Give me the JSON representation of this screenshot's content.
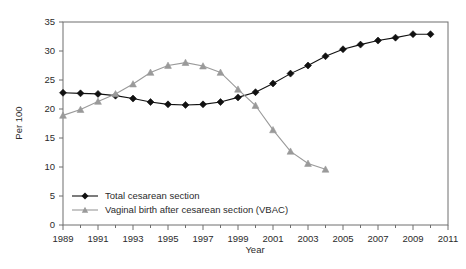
{
  "chart_data": {
    "type": "line",
    "title": "",
    "xlabel": "Year",
    "ylabel": "Per 100",
    "xlim": [
      1989,
      2011
    ],
    "ylim": [
      0,
      35
    ],
    "grid": false,
    "legend_position": "inside-bottom-left",
    "x_ticks": [
      "1989",
      "1991",
      "1993",
      "1995",
      "1997",
      "1999",
      "2001",
      "2003",
      "2005",
      "2007",
      "2009",
      "2011"
    ],
    "x_tick_values": [
      1989,
      1991,
      1993,
      1995,
      1997,
      1999,
      2001,
      2003,
      2005,
      2007,
      2009,
      2011
    ],
    "x_minor_tick_values": [
      1990,
      1992,
      1994,
      1996,
      1998,
      2000,
      2002,
      2004,
      2006,
      2008,
      2010
    ],
    "y_ticks": [
      "0",
      "5",
      "10",
      "15",
      "20",
      "25",
      "30",
      "35"
    ],
    "y_tick_values": [
      0,
      5,
      10,
      15,
      20,
      25,
      30,
      35
    ],
    "series": [
      {
        "name": "Total cesarean section",
        "marker": "diamond",
        "color": "#111111",
        "x": [
          1989,
          1990,
          1991,
          1992,
          1993,
          1994,
          1995,
          1996,
          1997,
          1998,
          1999,
          2000,
          2001,
          2002,
          2003,
          2004,
          2005,
          2006,
          2007,
          2008,
          2009,
          2010
        ],
        "values": [
          22.8,
          22.7,
          22.6,
          22.3,
          21.8,
          21.2,
          20.8,
          20.7,
          20.8,
          21.2,
          22.0,
          22.9,
          24.4,
          26.1,
          27.5,
          29.1,
          30.3,
          31.1,
          31.8,
          32.3,
          32.9,
          32.9
        ]
      },
      {
        "name": "Vaginal birth after cesarean section (VBAC)",
        "marker": "triangle",
        "color": "#9a9a9a",
        "x": [
          1989,
          1990,
          1991,
          1992,
          1993,
          1994,
          1995,
          1996,
          1997,
          1998,
          1999,
          2000,
          2001,
          2002,
          2003,
          2004
        ],
        "values": [
          18.9,
          19.9,
          21.3,
          22.6,
          24.3,
          26.3,
          27.5,
          28.0,
          27.4,
          26.3,
          23.4,
          20.6,
          16.4,
          12.7,
          10.6,
          9.6
        ]
      }
    ]
  },
  "legend": {
    "entries": [
      {
        "label": "Total cesarean section"
      },
      {
        "label": "Vaginal birth after cesarean section (VBAC)"
      }
    ]
  },
  "axes": {
    "x_title": "Year",
    "y_title": "Per 100"
  },
  "colors": {
    "series_total_cesarean": "#111111",
    "series_vbac": "#9a9a9a",
    "frame": "#6e6e6e",
    "text": "#2b2b2b",
    "background": "#ffffff"
  }
}
